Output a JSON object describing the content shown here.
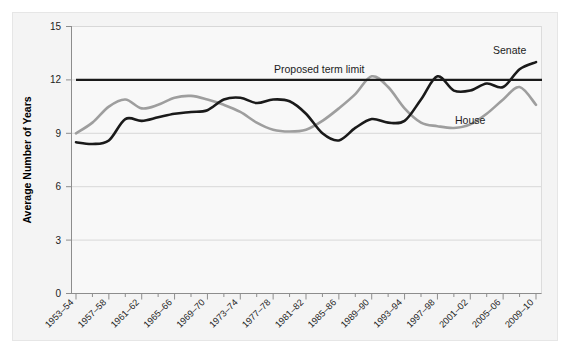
{
  "figure": {
    "background_color": "#f4f4f4",
    "frame_color": "#e6e6e6",
    "plot_background_color": "#f7f7f7"
  },
  "chart_data": {
    "type": "line",
    "title": "",
    "subtitle": "",
    "xlabel": "",
    "ylabel": "Average Number of Years",
    "ylim": [
      0,
      15
    ],
    "yticks": [
      0,
      3,
      6,
      9,
      12,
      15
    ],
    "ytick_labels": [
      "0",
      "3",
      "6",
      "9",
      "12",
      "15"
    ],
    "grid": true,
    "grid_axis": "y",
    "legend_position": "inline-annotation",
    "categories": [
      "1953–54",
      "1955–56",
      "1957–58",
      "1959–60",
      "1961–62",
      "1963–64",
      "1965–66",
      "1967–68",
      "1969–70",
      "1971–72",
      "1973–74",
      "1975–76",
      "1977–78",
      "1979–80",
      "1981–82",
      "1983–84",
      "1985–86",
      "1987–88",
      "1989–90",
      "1991–92",
      "1993–94",
      "1995–96",
      "1997–98",
      "1999–00",
      "2001–02",
      "2003–04",
      "2005–06",
      "2007–08",
      "2009–10"
    ],
    "xtick_labels_shown": [
      "1953–54",
      "1957–58",
      "1961–62",
      "1965–66",
      "1969–70",
      "1973–74",
      "1977–78",
      "1981–82",
      "1985–86",
      "1989–90",
      "1993–94",
      "1997–98",
      "2001–02",
      "2005–06",
      "2009–10"
    ],
    "series": [
      {
        "name": "Senate",
        "color": "#1a1a1a",
        "label_text": "Senate",
        "values": [
          8.5,
          8.4,
          8.6,
          9.8,
          9.7,
          9.9,
          10.1,
          10.2,
          10.3,
          10.9,
          11.0,
          10.7,
          10.9,
          10.8,
          10.1,
          9.0,
          8.6,
          9.3,
          9.8,
          9.6,
          9.7,
          10.9,
          12.2,
          11.4,
          11.4,
          11.8,
          11.6,
          12.6,
          13.0
        ]
      },
      {
        "name": "House",
        "color": "#9e9e9e",
        "label_text": "House",
        "values": [
          9.0,
          9.6,
          10.5,
          10.9,
          10.4,
          10.6,
          11.0,
          11.1,
          10.9,
          10.6,
          10.2,
          9.6,
          9.2,
          9.1,
          9.2,
          9.7,
          10.4,
          11.2,
          12.2,
          11.6,
          10.4,
          9.6,
          9.4,
          9.3,
          9.5,
          10.1,
          10.9,
          11.6,
          10.6
        ]
      }
    ],
    "reference_line": {
      "name": "Proposed term limit",
      "label_text": "Proposed term limit",
      "value": 12,
      "color": "#1a1a1a"
    }
  }
}
